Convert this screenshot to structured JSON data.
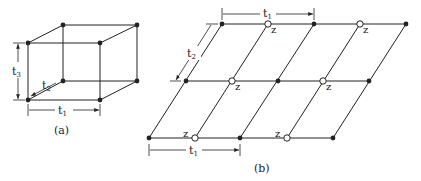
{
  "figure_a": {
    "caption": "(a)",
    "labels": {
      "t1": "t",
      "t1_sub": "1",
      "t2": "t",
      "t2_sub": "2",
      "t3": "t",
      "t3_sub": "3"
    },
    "vertices": {
      "btl": [
        63,
        25
      ],
      "btr": [
        137,
        25
      ],
      "ftl": [
        28,
        43
      ],
      "ftr": [
        100,
        43
      ],
      "bbl": [
        63,
        81
      ],
      "bbr": [
        137,
        81
      ],
      "fbl": [
        28,
        100
      ],
      "fbr": [
        100,
        100
      ]
    }
  },
  "figure_b": {
    "caption": "(b)",
    "labels": {
      "t1_top": "t",
      "t1_top_sub": "1",
      "t2": "t",
      "t2_sub": "2",
      "t1_bottom": "t",
      "t1_bottom_sub": "1",
      "z": "z"
    },
    "rows": [
      {
        "y": 24,
        "nodes": [
          [
            222,
            "filled"
          ],
          [
            268,
            "open"
          ],
          [
            314,
            "filled"
          ],
          [
            360,
            "open"
          ],
          [
            406,
            "filled"
          ]
        ]
      },
      {
        "y": 81,
        "nodes": [
          [
            186,
            "filled"
          ],
          [
            232,
            "open"
          ],
          [
            278,
            "filled"
          ],
          [
            323,
            "open"
          ],
          [
            369,
            "filled"
          ]
        ]
      },
      {
        "y": 138,
        "nodes": [
          [
            149,
            "filled"
          ],
          [
            195,
            "open"
          ],
          [
            240,
            "filled"
          ],
          [
            287,
            "open"
          ],
          [
            333,
            "filled"
          ]
        ]
      }
    ]
  },
  "colors": {
    "line": "#222222",
    "background": "#ffffff"
  }
}
